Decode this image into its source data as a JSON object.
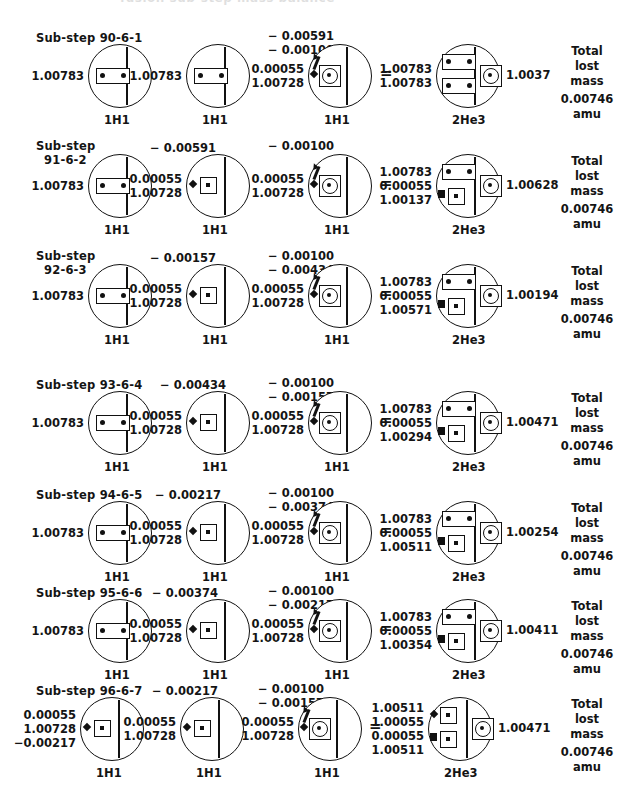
{
  "page": {
    "clipped_header": "fusion sub-step mass balance",
    "total_block": {
      "line1": "Total",
      "line2": "lost",
      "line3": "mass",
      "line4": "0.00746",
      "line5": "amu"
    },
    "equals": "=",
    "nuclide_h": "1H1",
    "nuclide_he": "2He3"
  },
  "rows": [
    {
      "substep_prefix": "Sub-step",
      "substep_id": "90-6-1",
      "substep_inline": true,
      "term2_minus": "",
      "top_minus": [
        "−  0.00591",
        "−  0.00100"
      ],
      "atom1": {
        "values": [
          "1.00783"
        ],
        "label": "1H1",
        "glyph": "rect2",
        "marker": "none"
      },
      "atom2": {
        "values": [
          "1.00783"
        ],
        "label": "1H1",
        "glyph": "rect2",
        "marker": "none"
      },
      "atom3": {
        "values": [
          "0.00055",
          "1.00728"
        ],
        "label": "1H1",
        "glyph": "core",
        "marker": "diamond",
        "arrow": true
      },
      "atom4": {
        "values": [
          "1.00783",
          "1.00783"
        ],
        "label": "2He3",
        "glyph": "two-rect2",
        "result": "1.0037"
      }
    },
    {
      "substep_prefix": "Sub-step",
      "substep_id": "91-6-2",
      "substep_inline": false,
      "term2_minus": "−  0.00591",
      "top_minus": [
        "−  0.00100"
      ],
      "atom1": {
        "values": [
          "1.00783"
        ],
        "label": "1H1",
        "glyph": "rect2",
        "marker": "none"
      },
      "atom2": {
        "values": [
          "0.00055",
          "1.00728"
        ],
        "label": "1H1",
        "glyph": "sq1",
        "marker": "diamond"
      },
      "atom3": {
        "values": [
          "0.00055",
          "1.00728"
        ],
        "label": "1H1",
        "glyph": "core",
        "marker": "diamond",
        "arrow": true
      },
      "atom4": {
        "values": [
          "1.00783",
          "0.00055",
          "1.00137"
        ],
        "label": "2He3",
        "glyph": "rect2-sq1",
        "result": "1.00628"
      }
    },
    {
      "substep_prefix": "Sub-step",
      "substep_id": "92-6-3",
      "substep_inline": false,
      "term2_minus": "−  0.00157",
      "top_minus": [
        "−  0.00100",
        "−  0.00434"
      ],
      "atom1": {
        "values": [
          "1.00783"
        ],
        "label": "1H1",
        "glyph": "rect2",
        "marker": "none"
      },
      "atom2": {
        "values": [
          "0.00055",
          "1.00728"
        ],
        "label": "1H1",
        "glyph": "sq1",
        "marker": "diamond"
      },
      "atom3": {
        "values": [
          "0.00055",
          "1.00728"
        ],
        "label": "1H1",
        "glyph": "core",
        "marker": "diamond",
        "arrow": true
      },
      "atom4": {
        "values": [
          "1.00783",
          "0.00055",
          "1.00571"
        ],
        "label": "2He3",
        "glyph": "rect2-sq1",
        "result": "1.00194"
      }
    },
    {
      "substep_prefix": "Sub-step",
      "substep_id": "93-6-4",
      "substep_inline": true,
      "term2_minus": "− 0.00434",
      "top_minus": [
        "−  0.00100",
        "−  0.00157"
      ],
      "atom1": {
        "values": [
          "1.00783"
        ],
        "label": "1H1",
        "glyph": "rect2",
        "marker": "none"
      },
      "atom2": {
        "values": [
          "0.00055",
          "1.00728"
        ],
        "label": "1H1",
        "glyph": "sq1",
        "marker": "diamond"
      },
      "atom3": {
        "values": [
          "0.00055",
          "1.00728"
        ],
        "label": "1H1",
        "glyph": "core",
        "marker": "diamond",
        "arrow": true
      },
      "atom4": {
        "values": [
          "1.00783",
          "0.00055",
          "1.00294"
        ],
        "label": "2He3",
        "glyph": "rect2-sq1",
        "result": "1.00471"
      }
    },
    {
      "substep_prefix": "Sub-step",
      "substep_id": "94-6-5",
      "substep_inline": true,
      "term2_minus": "− 0.00217",
      "top_minus": [
        "−  0.00100",
        "−  0.00374"
      ],
      "atom1": {
        "values": [
          "1.00783"
        ],
        "label": "1H1",
        "glyph": "rect2",
        "marker": "none"
      },
      "atom2": {
        "values": [
          "0.00055",
          "1.00728"
        ],
        "label": "1H1",
        "glyph": "sq1",
        "marker": "diamond"
      },
      "atom3": {
        "values": [
          "0.00055",
          "1.00728"
        ],
        "label": "1H1",
        "glyph": "core",
        "marker": "diamond",
        "arrow": true
      },
      "atom4": {
        "values": [
          "1.00783",
          "0.00055",
          "1.00511"
        ],
        "label": "2He3",
        "glyph": "rect2-sq1",
        "result": "1.00254"
      }
    },
    {
      "substep_prefix": "Sub-step",
      "substep_id": "95-6-6",
      "substep_inline": true,
      "term2_minus": "− 0.00374",
      "top_minus": [
        "−  0.00100",
        "−  0.00217"
      ],
      "atom1": {
        "values": [
          "1.00783"
        ],
        "label": "1H1",
        "glyph": "rect2",
        "marker": "none"
      },
      "atom2": {
        "values": [
          "0.00055",
          "1.00728"
        ],
        "label": "1H1",
        "glyph": "sq1",
        "marker": "diamond"
      },
      "atom3": {
        "values": [
          "0.00055",
          "1.00728"
        ],
        "label": "1H1",
        "glyph": "core",
        "marker": "diamond",
        "arrow": true
      },
      "atom4": {
        "values": [
          "1.00783",
          "0.00055",
          "1.00354"
        ],
        "label": "2He3",
        "glyph": "rect2-sq1",
        "result": "1.00411"
      }
    },
    {
      "substep_prefix": "Sub-step",
      "substep_id": "96-6-7",
      "substep_inline": true,
      "term2_minus": "− 0.00217",
      "top_minus": [
        "−  0.00100",
        "−  0.00157"
      ],
      "atom1": {
        "values": [
          "0.00055",
          "1.00728",
          "−0.00217"
        ],
        "label": "1H1",
        "glyph": "sq1",
        "marker": "diamond"
      },
      "atom2": {
        "values": [
          "0.00055",
          "1.00728"
        ],
        "label": "1H1",
        "glyph": "sq1",
        "marker": "diamond"
      },
      "atom3": {
        "values": [
          "0.00055",
          "1.00728"
        ],
        "label": "1H1",
        "glyph": "core",
        "marker": "diamond",
        "arrow": true
      },
      "atom4": {
        "values": [
          "1.00511",
          "1.00055",
          "0.00055",
          "1.00511"
        ],
        "label": "2He3",
        "glyph": "sq1-sq1",
        "result": "1.00471"
      }
    }
  ]
}
